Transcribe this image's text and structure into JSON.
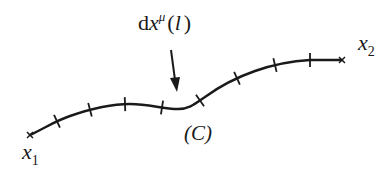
{
  "diagram": {
    "type": "curve-path",
    "curve_label": "(C)",
    "start_point_label": {
      "base": "x",
      "sub": "1"
    },
    "end_point_label": {
      "base": "x",
      "sub": "2"
    },
    "element_label": {
      "prefix": "d",
      "var": "x",
      "sup": "μ",
      "arg_open": "(",
      "arg": "l",
      "arg_close": ")"
    },
    "tick_count": 8,
    "arrow_target": "curve segment",
    "color": "#1a1a1a"
  }
}
